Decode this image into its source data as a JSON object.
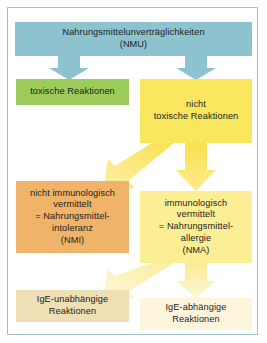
{
  "figure": {
    "type": "flowchart",
    "language": "de",
    "title_text": "Nahrungsmittelunverträglichkeiten (NMU)",
    "frame_border_color": "#9fc6cf",
    "background_color": "#ffffff"
  },
  "nodes": {
    "nmu": {
      "label": "Nahrungsmittelunverträglichkeiten\n(NMU)",
      "color": "#8cc3ce",
      "level": 1
    },
    "toxisch": {
      "label": "toxische Reaktionen",
      "color": "#9acb5b",
      "level": 2
    },
    "nicht_toxisch": {
      "label": "nicht\ntoxische Reaktionen",
      "color": "#fae75f",
      "level": 2
    },
    "nmi": {
      "label": "nicht immunologisch\nvermittelt\n= Nahrungsmittel-\nintoleranz\n(NMI)",
      "color": "#f0b36a",
      "level": 3
    },
    "nma": {
      "label": "immunologisch\nvermittelt\n= Nahrungsmittel-\nallergie\n(NMA)",
      "color": "#fbee95",
      "level": 3
    },
    "ige_unabhaengig": {
      "label": "IgE-unabhängige\nReaktionen",
      "color": "#eedfb4",
      "level": 4
    },
    "ige_abhaengig": {
      "label": "IgE-abhängige\nReaktionen",
      "color": "#fdf6dc",
      "level": 4
    }
  },
  "connectors": [
    {
      "name": "arrow-nmu-to-toxisch",
      "from": "nmu",
      "to": "toxisch",
      "direction": "down",
      "color": "#8cc3ce"
    },
    {
      "name": "arrow-nmu-to-nicht-toxisch",
      "from": "nmu",
      "to": "nicht_toxisch",
      "direction": "down",
      "color": "#8cc3ce"
    },
    {
      "name": "arrow-nicht-toxisch-to-nmi",
      "from": "nicht_toxisch",
      "to": "nmi",
      "direction": "down-left",
      "color": "#fbe07a"
    },
    {
      "name": "arrow-nicht-toxisch-to-nma",
      "from": "nicht_toxisch",
      "to": "nma",
      "direction": "down",
      "color": "#fbe35c"
    },
    {
      "name": "arrow-nma-to-ige-unabhaengig",
      "from": "nma",
      "to": "ige_unabhaengig",
      "direction": "down-left",
      "color": "#fcefb0"
    },
    {
      "name": "arrow-nma-to-ige-abhaengig",
      "from": "nma",
      "to": "ige_abhaengig",
      "direction": "down",
      "color": "#fbeb9a"
    }
  ]
}
